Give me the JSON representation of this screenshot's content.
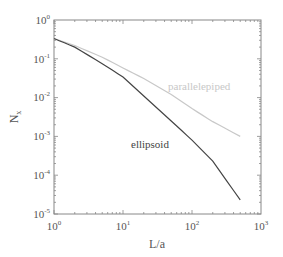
{
  "chart_data": {
    "type": "line",
    "title": "",
    "xlabel": "L/a",
    "ylabel": "N_x",
    "xscale": "log",
    "yscale": "log",
    "xlim": [
      1,
      1000
    ],
    "ylim": [
      1e-05,
      1
    ],
    "grid": false,
    "legend": "none (inline annotations)",
    "x_ticks": [
      "10^0",
      "10^1",
      "10^2",
      "10^3"
    ],
    "y_ticks": [
      "10^0",
      "10^-1",
      "10^-2",
      "10^-3",
      "10^-4",
      "10^-5"
    ],
    "series": [
      {
        "name": "ellipsoid",
        "color": "#444444",
        "x": [
          1,
          2,
          5,
          10,
          20,
          50,
          100,
          200,
          500
        ],
        "y": [
          0.333,
          0.2,
          0.075,
          0.034,
          0.011,
          0.0025,
          0.0008,
          0.00023,
          2.3e-05
        ]
      },
      {
        "name": "parallelepiped",
        "color": "#c8c8c8",
        "x": [
          1,
          2,
          5,
          10,
          20,
          50,
          100,
          200,
          500
        ],
        "y": [
          0.333,
          0.22,
          0.11,
          0.058,
          0.031,
          0.012,
          0.0052,
          0.0024,
          0.001
        ]
      }
    ],
    "annotations": [
      {
        "text": "parallelepiped",
        "x": 120,
        "y": 0.012
      },
      {
        "text": "ellipsoid",
        "x": 25,
        "y": 0.00085
      }
    ]
  },
  "labels": {
    "xlabel": "L/a",
    "ylabel_main": "N",
    "ylabel_sub": "x",
    "x_ticks": [
      {
        "base": "10",
        "exp": "0"
      },
      {
        "base": "10",
        "exp": "1"
      },
      {
        "base": "10",
        "exp": "2"
      },
      {
        "base": "10",
        "exp": "3"
      }
    ],
    "y_ticks": [
      {
        "base": "10",
        "exp": "0"
      },
      {
        "base": "10",
        "exp": "-1"
      },
      {
        "base": "10",
        "exp": "-2"
      },
      {
        "base": "10",
        "exp": "-3"
      },
      {
        "base": "10",
        "exp": "-4"
      },
      {
        "base": "10",
        "exp": "-5"
      }
    ],
    "anno_parallelepiped": "parallelepiped",
    "anno_ellipsoid": "ellipsoid"
  }
}
